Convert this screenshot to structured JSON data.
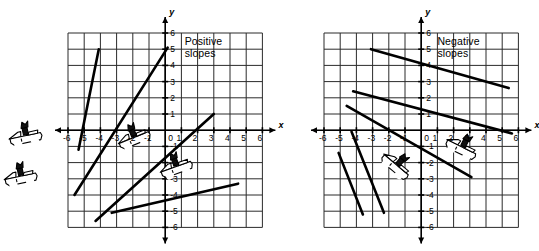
{
  "figure": {
    "type": "two-panel-coordinate-graph"
  },
  "panels": [
    {
      "id": "positive",
      "callout": {
        "line1": "Positive",
        "line2": "slopes"
      },
      "axes": {
        "x_name": "x",
        "y_name": "y",
        "x_ticks": [
          "-6",
          "-5",
          "-4",
          "-3",
          "-2",
          "-1",
          "1",
          "2",
          "3",
          "4",
          "5",
          "6"
        ],
        "y_ticks": [
          "6",
          "5",
          "4",
          "3",
          "2",
          "1",
          "-1",
          "-2",
          "-3",
          "-4",
          "-5",
          "-6"
        ],
        "origin_label": "0",
        "xlim": [
          -6.5,
          6.5
        ],
        "ylim": [
          -6.5,
          6.5
        ],
        "grid": true
      },
      "lines": [
        {
          "name": "very-steep-line",
          "x1": -5.35,
          "y1": -1.2,
          "x2": -4.1,
          "y2": 5.0,
          "slope": "steep positive"
        },
        {
          "name": "steep-line",
          "x1": -5.6,
          "y1": -4.0,
          "x2": 0.15,
          "y2": 5.1,
          "slope": "positive"
        },
        {
          "name": "moderate-line",
          "x1": -4.3,
          "y1": -5.6,
          "x2": 3.0,
          "y2": 1.0,
          "slope": "positive"
        },
        {
          "name": "gentle-line",
          "x1": -3.3,
          "y1": -5.1,
          "x2": 4.5,
          "y2": -3.3,
          "slope": "gentle positive"
        }
      ],
      "cars": [
        {
          "name": "car-outside-upper",
          "x": -8.6,
          "y": -0.4,
          "rotation": -12
        },
        {
          "name": "car-outside-lower",
          "x": -8.9,
          "y": -2.9,
          "rotation": -12
        },
        {
          "name": "car-on-steep-line",
          "x": -1.9,
          "y": -0.5,
          "rotation": -22
        },
        {
          "name": "car-on-moderate-line",
          "x": 0.7,
          "y": -2.3,
          "rotation": -20
        }
      ]
    },
    {
      "id": "negative",
      "callout": {
        "line1": "Negative",
        "line2": "slopes"
      },
      "axes": {
        "x_name": "x",
        "y_name": "y",
        "x_ticks": [
          "-6",
          "-5",
          "-4",
          "-3",
          "-2",
          "-1",
          "1",
          "2",
          "3",
          "4",
          "5",
          "6"
        ],
        "y_ticks": [
          "6",
          "5",
          "4",
          "3",
          "2",
          "1",
          "-1",
          "-2",
          "-3",
          "-4",
          "-5",
          "-6"
        ],
        "origin_label": "0",
        "xlim": [
          -6.5,
          6.5
        ],
        "ylim": [
          -6.5,
          6.5
        ],
        "grid": true
      },
      "lines": [
        {
          "name": "gentle-line",
          "x1": -3.1,
          "y1": 5.0,
          "x2": 5.4,
          "y2": 2.6,
          "slope": "gentle negative"
        },
        {
          "name": "moderate-line",
          "x1": -4.2,
          "y1": 2.4,
          "x2": 5.6,
          "y2": -0.2,
          "slope": "negative"
        },
        {
          "name": "steep-line",
          "x1": -4.6,
          "y1": 1.5,
          "x2": 3.1,
          "y2": -2.9,
          "slope": "negative"
        },
        {
          "name": "very-steep-line-a",
          "x1": -5.1,
          "y1": -1.4,
          "x2": -3.6,
          "y2": -5.2,
          "slope": "steep negative"
        },
        {
          "name": "very-steep-line-b",
          "x1": -4.3,
          "y1": -0.1,
          "x2": -2.3,
          "y2": -5.1,
          "slope": "steep negative"
        }
      ],
      "cars": [
        {
          "name": "car-on-steep-line",
          "x": -1.55,
          "y": -2.2,
          "rotation": 40
        },
        {
          "name": "car-on-moderate-line",
          "x": 2.5,
          "y": -1.1,
          "rotation": 26
        }
      ]
    }
  ]
}
